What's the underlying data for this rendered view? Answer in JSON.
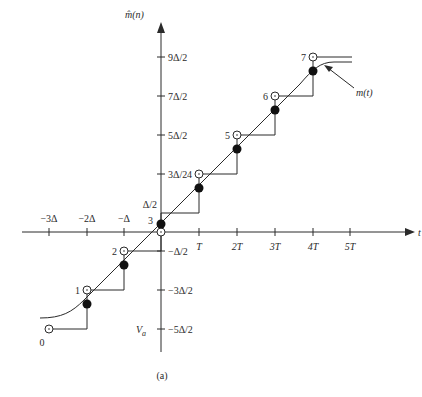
{
  "figure": {
    "caption": "(a)",
    "y_axis_label": "m̂(n)",
    "x_axis_label": "t",
    "curve_label": "m(t)",
    "va_label": "V",
    "va_sub": "a",
    "colors": {
      "ink": "#2a2a2a",
      "background": "#ffffff"
    }
  },
  "axes": {
    "x_ticks": [
      {
        "label": "−3Δ",
        "x": 49,
        "pos": "above"
      },
      {
        "label": "−2Δ",
        "x": 87,
        "pos": "above"
      },
      {
        "label": "−Δ",
        "x": 124,
        "pos": "above"
      },
      {
        "label": "T",
        "x": 199,
        "pos": "below"
      },
      {
        "label": "2T",
        "x": 237,
        "pos": "below"
      },
      {
        "label": "3T",
        "x": 275,
        "pos": "below"
      },
      {
        "label": "4T",
        "x": 313,
        "pos": "below"
      },
      {
        "label": "5T",
        "x": 350,
        "pos": "below"
      }
    ],
    "y_ticks_right": [
      {
        "label": "9Δ/2",
        "y": 57
      },
      {
        "label": "7Δ/2",
        "y": 96
      },
      {
        "label": "5Δ/2",
        "y": 135
      },
      {
        "label": "3Δ/2",
        "y": 174
      },
      {
        "label": "−Δ/2",
        "y": 251
      },
      {
        "label": "−3Δ/2",
        "y": 290
      },
      {
        "label": "−5Δ/2",
        "y": 329
      }
    ],
    "y_ticks_left": [
      {
        "label": "Δ/2",
        "y": 212
      }
    ]
  },
  "points": [
    {
      "index": "0",
      "x": 49,
      "y": 329
    },
    {
      "index": "1",
      "x": 87,
      "y": 290
    },
    {
      "index": "2",
      "x": 124,
      "y": 251
    },
    {
      "index": "3",
      "x": 161,
      "y": 232
    },
    {
      "index": "4",
      "x": 199,
      "y": 174
    },
    {
      "index": "5",
      "x": 237,
      "y": 135
    },
    {
      "index": "6",
      "x": 275,
      "y": 96
    },
    {
      "index": "7",
      "x": 313,
      "y": 57
    }
  ],
  "samples": [
    {
      "x": 87,
      "y": 304
    },
    {
      "x": 124,
      "y": 265
    },
    {
      "x": 161,
      "y": 224
    },
    {
      "x": 199,
      "y": 188
    },
    {
      "x": 237,
      "y": 149
    },
    {
      "x": 275,
      "y": 110
    },
    {
      "x": 313,
      "y": 71
    }
  ]
}
